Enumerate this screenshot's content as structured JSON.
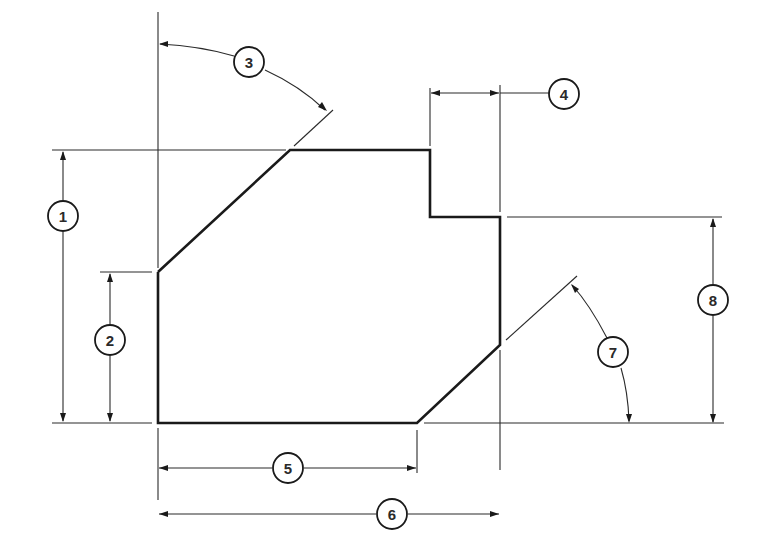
{
  "diagram": {
    "type": "technical-dimension-drawing",
    "colors": {
      "line": "#1a1a1a",
      "background": "#ffffff"
    },
    "callouts": [
      {
        "id": "1",
        "label": "1",
        "meaning": "overall height (left)"
      },
      {
        "id": "2",
        "label": "2",
        "meaning": "height of left vertical edge"
      },
      {
        "id": "3",
        "label": "3",
        "meaning": "angle of upper-left chamfer from vertical"
      },
      {
        "id": "4",
        "label": "4",
        "meaning": "width of upper-right step"
      },
      {
        "id": "5",
        "label": "5",
        "meaning": "length of bottom edge"
      },
      {
        "id": "6",
        "label": "6",
        "meaning": "overall width"
      },
      {
        "id": "7",
        "label": "7",
        "meaning": "angle of lower-right chamfer from horizontal"
      },
      {
        "id": "8",
        "label": "8",
        "meaning": "height of right side from step to bottom"
      }
    ]
  }
}
